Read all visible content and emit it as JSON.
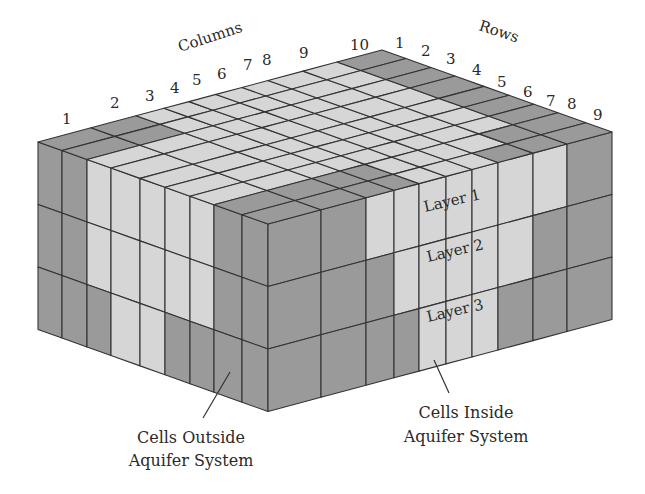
{
  "diagram": {
    "type": "3d-finite-difference-grid",
    "axes": {
      "columns_label": "Columns",
      "rows_label": "Rows",
      "column_ticks": [
        "1",
        "2",
        "3",
        "4",
        "5",
        "6",
        "7",
        "8",
        "9",
        "10"
      ],
      "row_ticks": [
        "1",
        "2",
        "3",
        "4",
        "5",
        "6",
        "7",
        "8",
        "9"
      ]
    },
    "layers": [
      "Layer 1",
      "Layer 2",
      "Layer 3"
    ],
    "callouts": {
      "outside": {
        "line1": "Cells Outside",
        "line2": "Aquifer System"
      },
      "inside": {
        "line1": "Cells Inside",
        "line2": "Aquifer System"
      }
    },
    "colors": {
      "inside_cell": "#d6d6d6",
      "outside_cell": "#9a9a9a",
      "grid_line": "#333333",
      "label_text": "#2a2a2a"
    },
    "geometry": {
      "front_top": [
        268,
        224
      ],
      "left_top": [
        38,
        142
      ],
      "right_top": [
        612,
        132
      ],
      "layer_height": 62.5,
      "front_left_stops_x": [
        38,
        62,
        87,
        111,
        140,
        165,
        190,
        214,
        242,
        268
      ],
      "front_right_stops_x": [
        268,
        321,
        366,
        394,
        419,
        446,
        472,
        498,
        533,
        567,
        612
      ]
    },
    "front_left_face": [
      [
        "D",
        "D",
        "L",
        "L",
        "L",
        "L",
        "L",
        "D",
        "D"
      ],
      [
        "D",
        "D",
        "L",
        "L",
        "L",
        "L",
        "L",
        "D",
        "D"
      ],
      [
        "D",
        "D",
        "D",
        "L",
        "L",
        "D",
        "D",
        "D",
        "D"
      ]
    ],
    "front_right_face": [
      [
        "D",
        "D",
        "L",
        "L",
        "L",
        "L",
        "L",
        "L",
        "L",
        "D"
      ],
      [
        "D",
        "D",
        "D",
        "L",
        "L",
        "L",
        "L",
        "L",
        "D",
        "D"
      ],
      [
        "D",
        "D",
        "D",
        "D",
        "L",
        "L",
        "L",
        "D",
        "D",
        "D"
      ]
    ],
    "top_face": [
      [
        "D",
        "D",
        "D",
        "D",
        "L",
        "L",
        "L",
        "D",
        "D",
        "D"
      ],
      [
        "D",
        "D",
        "D",
        "D",
        "L",
        "L",
        "L",
        "L",
        "D",
        "D"
      ],
      [
        "L",
        "L",
        "L",
        "L",
        "L",
        "L",
        "L",
        "L",
        "L",
        "D"
      ],
      [
        "L",
        "L",
        "L",
        "L",
        "L",
        "L",
        "L",
        "L",
        "L",
        "D"
      ],
      [
        "L",
        "L",
        "L",
        "L",
        "L",
        "L",
        "L",
        "L",
        "L",
        "D"
      ],
      [
        "L",
        "L",
        "L",
        "L",
        "L",
        "L",
        "L",
        "L",
        "L",
        "D"
      ],
      [
        "L",
        "L",
        "L",
        "L",
        "L",
        "L",
        "L",
        "L",
        "L",
        "D"
      ],
      [
        "D",
        "D",
        "L",
        "L",
        "L",
        "L",
        "L",
        "L",
        "L",
        "D"
      ],
      [
        "D",
        "D",
        "L",
        "L",
        "L",
        "L",
        "L",
        "L",
        "L",
        "D"
      ]
    ]
  }
}
